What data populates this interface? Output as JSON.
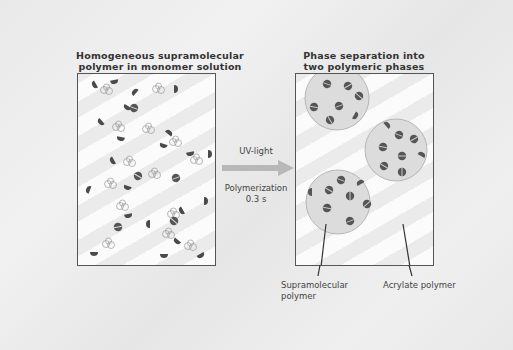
{
  "panels": {
    "left": {
      "title_line1": "Homogeneous supramolecular",
      "title_line2": "polymer in monomer solution"
    },
    "right": {
      "title_line1": "Phase separation into",
      "title_line2": "two polymeric phases"
    }
  },
  "process": {
    "trigger": "UV-light",
    "step_line1": "Polymerization",
    "step_line2": "0.3 s",
    "arrow_color": "#b5b5b5"
  },
  "callouts": {
    "supramolecular_line1": "Supramolecular",
    "supramolecular_line2": "polymer",
    "acrylate": "Acrylate polymer"
  },
  "colors": {
    "background": "#ececec",
    "box_border": "#555555",
    "droplet_fill": "#dcdcdc",
    "unit_fill": "#5a5a5a",
    "text": "#333333"
  }
}
